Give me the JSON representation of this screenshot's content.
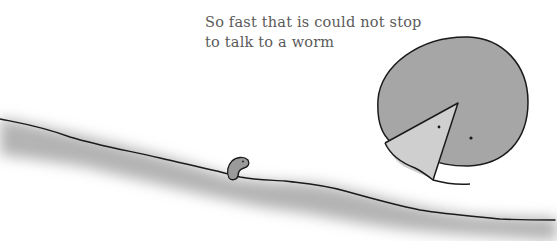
{
  "illustration": {
    "caption": {
      "line1": "So fast that is could not stop",
      "line2": "to talk to a worm"
    },
    "characters": [
      {
        "name": "round-creature",
        "description": "grey circle with a pale triangular mouth wedge and two dot eyes"
      },
      {
        "name": "worm",
        "description": "small grey worm peeking from the ground"
      }
    ],
    "colors": {
      "background": "#ffffff",
      "creature_body": "#a6a6a6",
      "creature_mouth": "#cfcfcf",
      "ground_shade": "#b0b0b0",
      "outline": "#1a1a1a",
      "text": "#5a5a5a"
    }
  }
}
